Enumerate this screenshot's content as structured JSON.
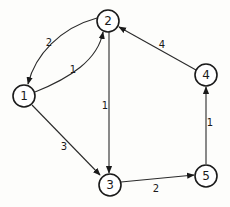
{
  "diagram": {
    "type": "weighted-directed-graph",
    "nodes": [
      {
        "id": "1",
        "label": "1",
        "x": 24,
        "y": 96
      },
      {
        "id": "2",
        "label": "2",
        "x": 108,
        "y": 21
      },
      {
        "id": "3",
        "label": "3",
        "x": 110,
        "y": 185
      },
      {
        "id": "4",
        "label": "4",
        "x": 206,
        "y": 75
      },
      {
        "id": "5",
        "label": "5",
        "x": 206,
        "y": 176
      }
    ],
    "edges": [
      {
        "from": "2",
        "to": "1",
        "weight": "2"
      },
      {
        "from": "1",
        "to": "2",
        "weight": "1"
      },
      {
        "from": "1",
        "to": "3",
        "weight": "3"
      },
      {
        "from": "2",
        "to": "3",
        "weight": "1"
      },
      {
        "from": "3",
        "to": "5",
        "weight": "2"
      },
      {
        "from": "5",
        "to": "4",
        "weight": "1"
      },
      {
        "from": "4",
        "to": "2",
        "weight": "4"
      }
    ]
  }
}
